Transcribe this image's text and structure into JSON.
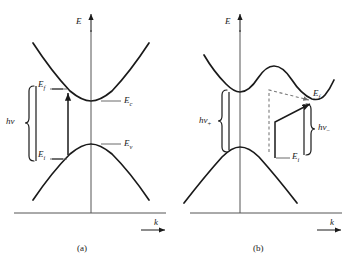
{
  "figure": {
    "kind": "band-structure-E-k-diagram",
    "panels": [
      {
        "id": "a",
        "caption": "(a)",
        "axes": {
          "y_label": "E",
          "x_label": "k"
        },
        "labels": {
          "final_state": "E",
          "final_state_sub": "f",
          "initial_state": "E",
          "initial_state_sub": "i",
          "conduction_band": "E",
          "conduction_band_sub": "c",
          "valence_band": "E",
          "valence_band_sub": "v",
          "photon": "h",
          "photon_nu": "ν",
          "photon_sub": ""
        }
      },
      {
        "id": "b",
        "caption": "(b)",
        "axes": {
          "y_label": "E",
          "x_label": "k"
        },
        "labels": {
          "final_state": "E",
          "final_state_sub": "f",
          "initial_state": "E",
          "initial_state_sub": "i",
          "photon_plus": "h",
          "photon_plus_nu": "ν",
          "photon_plus_sub": "+",
          "photon_minus": "h",
          "photon_minus_nu": "ν",
          "photon_minus_sub": "−"
        }
      }
    ],
    "colors": {
      "ink": "#1a1a1a",
      "axis": "#4a4a4a",
      "dashed": "#7a7a7a",
      "background": "#ffffff"
    }
  }
}
